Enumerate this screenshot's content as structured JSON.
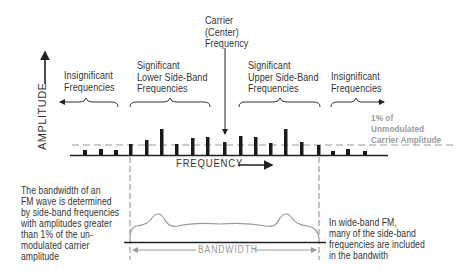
{
  "diagram": {
    "axes": {
      "y_label": "AMPLITUDE",
      "x_label": "FREQUENCY"
    },
    "labels": {
      "carrier": [
        "Carrier",
        "(Center)",
        "Frequency"
      ],
      "insignificant_left": [
        "Insignificant",
        "Frequencies"
      ],
      "significant_lower": [
        "Significant",
        "Lower Side-Band",
        "Frequencies"
      ],
      "significant_upper": [
        "Significant",
        "Upper Side-Band",
        "Frequencies"
      ],
      "insignificant_right": [
        "Insignificant",
        "Frequencies"
      ],
      "threshold": [
        "1% of",
        "Unmodulated",
        "Carrier Amplitude"
      ],
      "left_note": [
        "The bandwidth of an",
        "FM wave is determined",
        "by side-band frequencies",
        "with amplitudes greater",
        "than 1% of the un-",
        "modulated carrier",
        "amplitude"
      ],
      "right_note": [
        "In wide-band FM,",
        "many of the side-band",
        "frequencies are included",
        "in the bandwith"
      ],
      "bandwidth": "BANDWIDTH"
    },
    "spectrum": {
      "bars": [
        {
          "x": 85,
          "top": 150,
          "significant": false
        },
        {
          "x": 101,
          "top": 149,
          "significant": false
        },
        {
          "x": 116,
          "top": 150,
          "significant": false
        },
        {
          "x": 131,
          "top": 144,
          "significant": true
        },
        {
          "x": 147,
          "top": 140,
          "significant": true
        },
        {
          "x": 162,
          "top": 129,
          "significant": true
        },
        {
          "x": 177,
          "top": 144,
          "significant": true
        },
        {
          "x": 193,
          "top": 138,
          "significant": true
        },
        {
          "x": 208,
          "top": 137,
          "significant": true
        },
        {
          "x": 225,
          "top": 142,
          "significant": true,
          "carrier": true
        },
        {
          "x": 241,
          "top": 136,
          "significant": true
        },
        {
          "x": 256,
          "top": 137,
          "significant": true
        },
        {
          "x": 271,
          "top": 143,
          "significant": true
        },
        {
          "x": 286,
          "top": 129,
          "significant": true
        },
        {
          "x": 302,
          "top": 142,
          "significant": true
        },
        {
          "x": 319,
          "top": 145,
          "significant": true
        },
        {
          "x": 333,
          "top": 151,
          "significant": false
        },
        {
          "x": 348,
          "top": 149,
          "significant": false
        },
        {
          "x": 365,
          "top": 151,
          "significant": false
        }
      ],
      "baseline_y": 155,
      "threshold_y": 145
    },
    "colors": {
      "ink": "#222222",
      "gray": "#9a9a9a"
    }
  }
}
